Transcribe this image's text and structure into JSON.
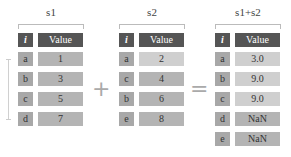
{
  "s1": {
    "title": "s1",
    "header": {
      "index": "i",
      "value": "Value"
    },
    "rows": [
      {
        "index": "a",
        "value": "1"
      },
      {
        "index": "b",
        "value": "3"
      },
      {
        "index": "c",
        "value": "5"
      },
      {
        "index": "d",
        "value": "7"
      }
    ]
  },
  "s2": {
    "title": "s2",
    "header": {
      "index": "i",
      "value": "Value"
    },
    "rows": [
      {
        "index": "a",
        "value": "2"
      },
      {
        "index": "c",
        "value": "4"
      },
      {
        "index": "b",
        "value": "6"
      },
      {
        "index": "e",
        "value": "8"
      }
    ]
  },
  "result": {
    "title": "s1+s2",
    "header": {
      "index": "i",
      "value": "Value"
    },
    "rows": [
      {
        "index": "a",
        "value": "3.0"
      },
      {
        "index": "b",
        "value": "9.0"
      },
      {
        "index": "c",
        "value": "9.0"
      },
      {
        "index": "d",
        "value": "NaN"
      },
      {
        "index": "e",
        "value": "NaN"
      }
    ]
  },
  "operators": {
    "plus": "+",
    "equals": "="
  }
}
